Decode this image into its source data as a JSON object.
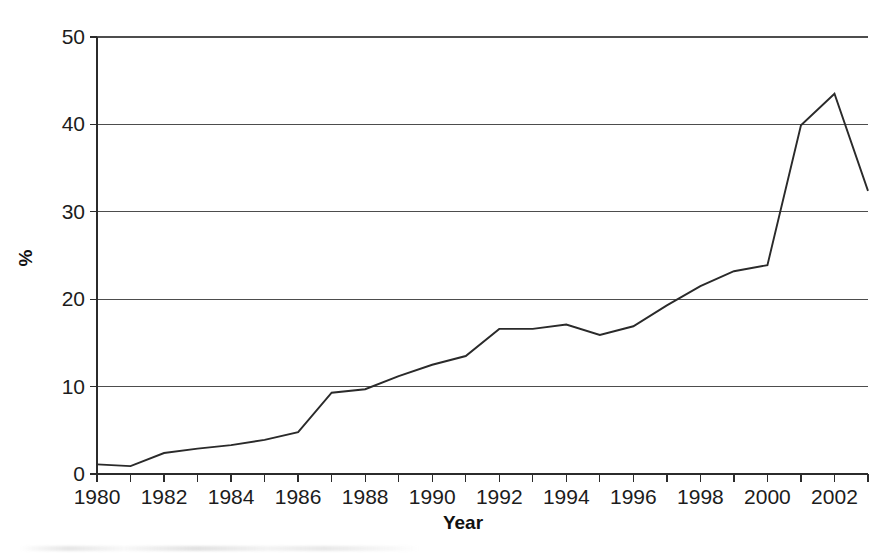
{
  "chart_data": {
    "type": "line",
    "title": "",
    "subtitle": "",
    "xlabel": "Year",
    "ylabel": "%",
    "xlim": [
      1980,
      2003
    ],
    "ylim": [
      0,
      50
    ],
    "grid": "horizontal",
    "legend": "none",
    "y_ticks": [
      0,
      10,
      20,
      30,
      40,
      50
    ],
    "y_tick_labels": [
      "0",
      "10",
      "20",
      "30",
      "40",
      "50"
    ],
    "x_ticks": [
      1980,
      1981,
      1982,
      1983,
      1984,
      1985,
      1986,
      1987,
      1988,
      1989,
      1990,
      1991,
      1992,
      1993,
      1994,
      1995,
      1996,
      1997,
      1998,
      1999,
      2000,
      2001,
      2002,
      2003
    ],
    "x_tick_labels": [
      "1980",
      "",
      "1982",
      "",
      "1984",
      "",
      "1986",
      "",
      "1988",
      "",
      "1990",
      "",
      "1992",
      "",
      "1994",
      "",
      "1996",
      "",
      "1998",
      "",
      "2000",
      "",
      "2002",
      ""
    ],
    "x_labeled_ticks": [
      {
        "year": 1980,
        "label": "1980"
      },
      {
        "year": 1982,
        "label": "1982"
      },
      {
        "year": 1984,
        "label": "1984"
      },
      {
        "year": 1986,
        "label": "1986"
      },
      {
        "year": 1988,
        "label": "1988"
      },
      {
        "year": 1990,
        "label": "1990"
      },
      {
        "year": 1992,
        "label": "1992"
      },
      {
        "year": 1994,
        "label": "1994"
      },
      {
        "year": 1996,
        "label": "1996"
      },
      {
        "year": 1998,
        "label": "1998"
      },
      {
        "year": 2000,
        "label": "2000"
      },
      {
        "year": 2002,
        "label": "2002"
      }
    ],
    "x": [
      1980,
      1981,
      1982,
      1983,
      1984,
      1985,
      1986,
      1987,
      1988,
      1989,
      1990,
      1991,
      1992,
      1993,
      1994,
      1995,
      1996,
      1997,
      1998,
      1999,
      2000,
      2001,
      2002,
      2003
    ],
    "values": [
      1.1,
      0.9,
      2.4,
      2.9,
      3.3,
      3.9,
      4.8,
      9.3,
      9.7,
      11.2,
      12.5,
      13.5,
      16.6,
      16.6,
      17.1,
      15.9,
      16.9,
      19.3,
      21.5,
      23.2,
      23.9,
      39.9,
      43.5,
      32.4
    ],
    "series": [
      {
        "name": "",
        "color": "#2a2a2a",
        "values": [
          1.1,
          0.9,
          2.4,
          2.9,
          3.3,
          3.9,
          4.8,
          9.3,
          9.7,
          11.2,
          12.5,
          13.5,
          16.6,
          16.6,
          17.1,
          15.9,
          16.9,
          19.3,
          21.5,
          23.2,
          23.9,
          39.9,
          43.5,
          32.4
        ]
      }
    ],
    "colors": {
      "line": "#2a2a2a",
      "grid": "#4d4d4d",
      "axis": "#2b2b2b",
      "text": "#1c1c1c",
      "background": "#ffffff"
    },
    "plot_area": {
      "left": 97,
      "right": 868,
      "top": 37,
      "bottom": 474
    }
  }
}
